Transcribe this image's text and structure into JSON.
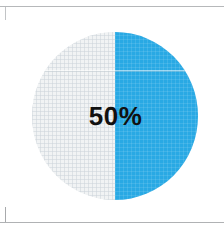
{
  "chart_data": {
    "type": "pie",
    "title": "",
    "subtitle": "",
    "xlabel": "",
    "ylabel": "",
    "center_label": "50%",
    "legend": [],
    "legend_position": "none",
    "grid": false,
    "categories": [
      "Completed",
      "Remaining"
    ],
    "values": [
      50,
      50
    ],
    "units": "percent",
    "total": 100,
    "slices": [
      {
        "name": "Completed",
        "value": 50,
        "color": "#29a9e4",
        "start_angle": 0,
        "end_angle": 180
      },
      {
        "name": "Remaining",
        "value": 50,
        "color": "#f1f3f4",
        "start_angle": 180,
        "end_angle": 360
      }
    ],
    "annotations": [
      "50%"
    ]
  },
  "frame": {
    "background_color": "#ffffff",
    "rule_color": "#b6b8ba",
    "bracket_color": "#c2c4c6"
  },
  "colors": {
    "accent": "#29a9e4",
    "track": "#f1f3f4",
    "label": "#111111"
  }
}
